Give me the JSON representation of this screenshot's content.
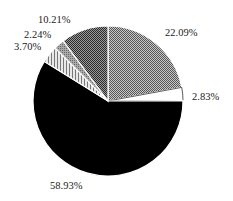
{
  "chart_data": {
    "type": "pie",
    "title": "",
    "start_angle_deg": 0,
    "direction": "clockwise",
    "slices": [
      {
        "label": "22.09%",
        "value": 22.09,
        "pattern": "dense-checker-gray",
        "color": "#8a8a8a",
        "label_pos": [
          165,
          36
        ]
      },
      {
        "label": "2.83%",
        "value": 2.83,
        "pattern": "white",
        "color": "#ffffff",
        "label_pos": [
          192,
          100
        ]
      },
      {
        "label": "58.93%",
        "value": 58.93,
        "pattern": "solid-black",
        "color": "#000000",
        "label_pos": [
          50,
          189
        ]
      },
      {
        "label": "3.70%",
        "value": 3.7,
        "pattern": "fine-hatch-light",
        "color": "#b8b8b8",
        "label_pos": [
          14,
          50
        ]
      },
      {
        "label": "2.24%",
        "value": 2.24,
        "pattern": "medium-gray",
        "color": "#9a9a9a",
        "label_pos": [
          24,
          38
        ]
      },
      {
        "label": "10.21%",
        "value": 10.21,
        "pattern": "dark-checker-gray",
        "color": "#5a5a5a",
        "label_pos": [
          38,
          23
        ]
      }
    ],
    "center": [
      108,
      101
    ],
    "radius": 75
  }
}
